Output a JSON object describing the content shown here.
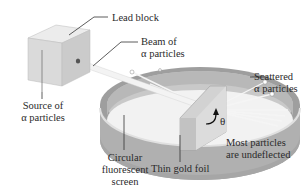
{
  "diagram": {
    "labels": {
      "lead_block": "Lead block",
      "beam_line1": "Beam of",
      "beam_line2": "α particles",
      "source_line1": "Source of",
      "source_line2": "α particles",
      "scattered_line1": "Scattered",
      "scattered_line2": "α particles",
      "circular_line1": "Circular",
      "circular_line2": "fluorescent",
      "circular_line3": "screen",
      "foil": "Thin gold foil",
      "undeflected_line1": "Most particles",
      "undeflected_line2": "are undeflected",
      "angle": "θ"
    },
    "colors": {
      "block_front": "#d9d9d9",
      "block_top": "#ececec",
      "block_side": "#c4c4c4",
      "screen_outer": "#a9a9a9",
      "screen_inner": "#c8c8c8",
      "screen_top_rim": "#e6e6e6",
      "foil": "#d4d4d4",
      "beam": "#f4f4f4",
      "leader_line": "#333333"
    }
  }
}
